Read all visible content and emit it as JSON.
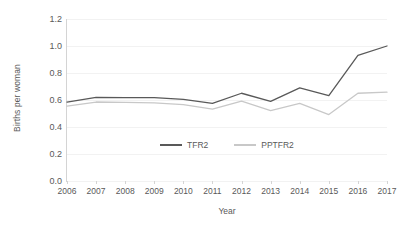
{
  "chart_data": {
    "type": "line",
    "title": "",
    "xlabel": "Year",
    "ylabel": "Births per woman",
    "categories": [
      "2006",
      "2007",
      "2008",
      "2009",
      "2010",
      "2011",
      "2012",
      "2013",
      "2014",
      "2015",
      "2016",
      "2017"
    ],
    "x": [
      2006,
      2007,
      2008,
      2009,
      2010,
      2011,
      2012,
      2013,
      2014,
      2015,
      2016,
      2017
    ],
    "xlim": [
      2006,
      2017
    ],
    "ylim": [
      0.0,
      1.2
    ],
    "yticks": [
      "0.0",
      "0.2",
      "0.4",
      "0.6",
      "0.8",
      "1.0",
      "1.2"
    ],
    "ytick_values": [
      0.0,
      0.2,
      0.4,
      0.6,
      0.8,
      1.0,
      1.2
    ],
    "grid": true,
    "grid_axis": "y",
    "legend_position": "inside-center",
    "series": [
      {
        "name": "TFR2",
        "color": "#595959",
        "values": [
          0.585,
          0.62,
          0.618,
          0.617,
          0.605,
          0.575,
          0.65,
          0.59,
          0.69,
          0.632,
          0.93,
          1.0
        ]
      },
      {
        "name": "PPTFR2",
        "color": "#c8c8c8",
        "values": [
          0.555,
          0.585,
          0.582,
          0.578,
          0.565,
          0.532,
          0.592,
          0.522,
          0.575,
          0.492,
          0.65,
          0.658
        ]
      }
    ]
  },
  "colors": {
    "tfr2": "#595959",
    "pptfr2": "#c8c8c8",
    "gridline": "#f2f2f2",
    "axis": "#d4d4d4",
    "text": "#595959",
    "background": "#ffffff"
  }
}
